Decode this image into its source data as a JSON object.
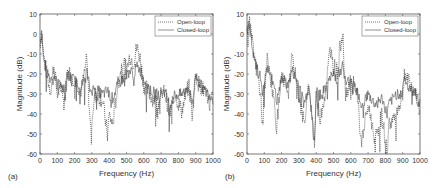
{
  "chart_data": [
    {
      "panel": "(a)",
      "type": "line",
      "title": "",
      "xlabel": "Frequency (Hz)",
      "ylabel": "Magnitude (dB)",
      "xlim": [
        0,
        1000
      ],
      "ylim": [
        -60,
        10
      ],
      "xticks": [
        0,
        100,
        200,
        300,
        400,
        500,
        600,
        700,
        800,
        900,
        1000
      ],
      "yticks": [
        10,
        0,
        -10,
        -20,
        -30,
        -40,
        -50,
        -60
      ],
      "grid": false,
      "legend_position": "upper right",
      "series": [
        {
          "name": "Open-loop",
          "style": "dotted",
          "x": [
            0,
            10,
            20,
            40,
            60,
            80,
            100,
            120,
            140,
            160,
            200,
            240,
            270,
            290,
            320,
            360,
            390,
            400,
            420,
            450,
            480,
            500,
            520,
            540,
            560,
            580,
            600,
            640,
            680,
            720,
            750,
            780,
            820,
            860,
            880,
            900,
            920,
            950,
            980,
            1000
          ],
          "values": [
            -5,
            2,
            -10,
            -20,
            -28,
            -15,
            -30,
            -25,
            -35,
            -18,
            -22,
            -28,
            -12,
            -45,
            -30,
            -32,
            -50,
            -40,
            -45,
            -25,
            -12,
            -18,
            -10,
            -14,
            -6,
            -12,
            -25,
            -30,
            -35,
            -28,
            -40,
            -30,
            -38,
            -25,
            -40,
            -20,
            -25,
            -28,
            -35,
            -30
          ]
        },
        {
          "name": "Closed-loop",
          "style": "solid",
          "x": [
            0,
            10,
            20,
            40,
            60,
            80,
            100,
            120,
            140,
            160,
            200,
            240,
            270,
            290,
            320,
            360,
            390,
            400,
            420,
            450,
            480,
            500,
            520,
            540,
            560,
            580,
            600,
            640,
            680,
            720,
            750,
            780,
            820,
            860,
            880,
            900,
            920,
            950,
            980,
            1000
          ],
          "values": [
            -5,
            0,
            -12,
            -18,
            -22,
            -20,
            -25,
            -24,
            -28,
            -20,
            -23,
            -26,
            -18,
            -28,
            -27,
            -30,
            -28,
            -30,
            -32,
            -25,
            -22,
            -20,
            -18,
            -20,
            -16,
            -18,
            -22,
            -28,
            -30,
            -28,
            -35,
            -30,
            -30,
            -26,
            -35,
            -20,
            -24,
            -28,
            -30,
            -32
          ]
        }
      ]
    },
    {
      "panel": "(b)",
      "type": "line",
      "title": "",
      "xlabel": "Frequency (Hz)",
      "ylabel": "Magnitude (dB)",
      "xlim": [
        0,
        1000
      ],
      "ylim": [
        -60,
        10
      ],
      "xticks": [
        0,
        100,
        200,
        300,
        400,
        500,
        600,
        700,
        800,
        900,
        1000
      ],
      "yticks": [
        10,
        0,
        -10,
        -20,
        -30,
        -40,
        -50,
        -60
      ],
      "grid": false,
      "legend_position": "upper right",
      "series": [
        {
          "name": "Open-loop",
          "style": "dotted",
          "x": [
            0,
            10,
            20,
            40,
            60,
            80,
            90,
            100,
            120,
            140,
            160,
            170,
            200,
            240,
            260,
            300,
            330,
            360,
            390,
            400,
            420,
            450,
            480,
            500,
            520,
            540,
            555,
            570,
            600,
            640,
            660,
            700,
            740,
            780,
            810,
            820,
            860,
            900,
            910,
            940,
            970,
            1000
          ],
          "values": [
            5,
            8,
            2,
            -10,
            -20,
            -30,
            -46,
            -28,
            -10,
            -25,
            -35,
            -46,
            -22,
            -28,
            -12,
            -30,
            -45,
            -25,
            -55,
            -30,
            -42,
            -30,
            -8,
            -15,
            -18,
            -5,
            2,
            -30,
            -22,
            -30,
            -55,
            -35,
            -52,
            -40,
            -60,
            -45,
            -40,
            -30,
            -18,
            -25,
            -28,
            -40
          ]
        },
        {
          "name": "Closed-loop",
          "style": "solid",
          "x": [
            0,
            10,
            20,
            40,
            60,
            80,
            90,
            100,
            120,
            140,
            160,
            170,
            200,
            240,
            260,
            300,
            330,
            360,
            390,
            400,
            420,
            450,
            480,
            500,
            520,
            540,
            555,
            570,
            600,
            640,
            660,
            700,
            740,
            780,
            810,
            820,
            860,
            900,
            910,
            940,
            970,
            1000
          ],
          "values": [
            2,
            5,
            0,
            -12,
            -18,
            -22,
            -30,
            -25,
            -15,
            -22,
            -25,
            -35,
            -22,
            -25,
            -18,
            -25,
            -35,
            -25,
            -55,
            -28,
            -30,
            -28,
            -22,
            -20,
            -22,
            -18,
            -15,
            -25,
            -22,
            -28,
            -35,
            -30,
            -35,
            -32,
            -40,
            -35,
            -30,
            -28,
            -22,
            -28,
            -28,
            -35
          ]
        }
      ]
    }
  ],
  "panels": [
    {
      "label": "(a)",
      "xlabel": "Frequency (Hz)",
      "ylabel": "Magnitude (dB)",
      "legend": [
        "Open-loop",
        "Closed-loop"
      ]
    },
    {
      "label": "(b)",
      "xlabel": "Frequency (Hz)",
      "ylabel": "Magnitude (dB)",
      "legend": [
        "Open-loop",
        "Closed-loop"
      ]
    }
  ],
  "ticks": {
    "x": [
      "0",
      "100",
      "200",
      "300",
      "400",
      "500",
      "600",
      "700",
      "800",
      "900",
      "1000"
    ],
    "y": [
      "10",
      "0",
      "-10",
      "-20",
      "-30",
      "-40",
      "-50",
      "-60"
    ]
  },
  "colors": {
    "axis": "#555555",
    "open_loop": "#333333",
    "closed_loop": "#444444"
  }
}
